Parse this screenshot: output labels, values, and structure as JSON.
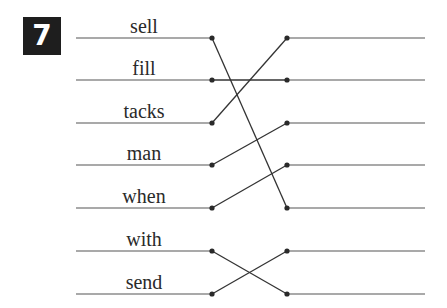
{
  "exercise": {
    "number": "7",
    "badge_color": "#1e1e1e",
    "line_color": "#555555",
    "words": [
      "sell",
      "fill",
      "tacks",
      "man",
      "when",
      "with",
      "send"
    ],
    "row_y": [
      38,
      80,
      123,
      165,
      208,
      251,
      294
    ],
    "connections": [
      {
        "from": 0,
        "to": 4
      },
      {
        "from": 1,
        "to": 1
      },
      {
        "from": 2,
        "to": 0
      },
      {
        "from": 3,
        "to": 2
      },
      {
        "from": 4,
        "to": 3
      },
      {
        "from": 5,
        "to": 6
      },
      {
        "from": 6,
        "to": 5
      }
    ]
  }
}
